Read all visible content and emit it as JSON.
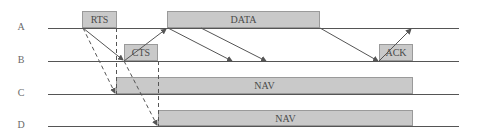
{
  "diagram": {
    "type": "timing-diagram",
    "stations": [
      {
        "label": "A",
        "y": 28
      },
      {
        "label": "B",
        "y": 61
      },
      {
        "label": "C",
        "y": 94
      },
      {
        "label": "D",
        "y": 126
      }
    ],
    "frames": [
      {
        "label": "RTS",
        "station": "A",
        "x1": 82,
        "x2": 117
      },
      {
        "label": "CTS",
        "station": "B",
        "x1": 124,
        "x2": 158
      },
      {
        "label": "DATA",
        "station": "A",
        "x1": 167,
        "x2": 320
      },
      {
        "label": "ACK",
        "station": "B",
        "x1": 379,
        "x2": 413
      },
      {
        "label": "NAV",
        "station": "C",
        "x1": 116,
        "x2": 413
      },
      {
        "label": "NAV",
        "station": "D",
        "x1": 158,
        "x2": 413
      }
    ],
    "colors": {
      "frame_fill": "#c9c9c9",
      "frame_border": "#9a9a9a",
      "line": "#555555",
      "text": "#4a4a4a"
    }
  }
}
